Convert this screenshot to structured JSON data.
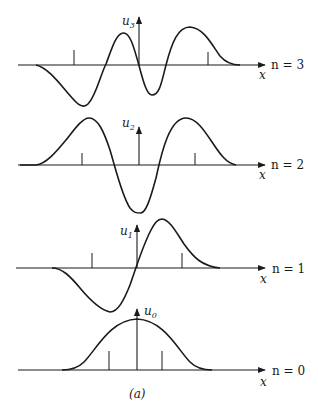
{
  "figure": {
    "caption": "(a)",
    "axis_label": "x",
    "panels": [
      {
        "id": "n3",
        "n_label": "n = 3",
        "u_label": "u",
        "u_sub": "3"
      },
      {
        "id": "n2",
        "n_label": "n = 2",
        "u_label": "u",
        "u_sub": "2"
      },
      {
        "id": "n1",
        "n_label": "n = 1",
        "u_label": "u",
        "u_sub": "1"
      },
      {
        "id": "n0",
        "n_label": "n = 0",
        "u_label": "u",
        "u_sub": "0"
      }
    ]
  },
  "colors": {
    "ink": "#1a1a1a",
    "background": "#ffffff"
  }
}
